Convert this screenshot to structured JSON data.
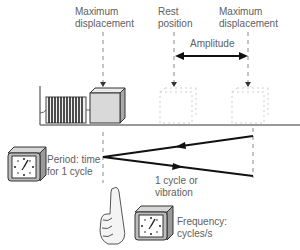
{
  "labels": {
    "max_disp_left_l1": "Maximum",
    "max_disp_left_l2": "displacement",
    "rest_l1": "Rest",
    "rest_l2": "position",
    "max_disp_right_l1": "Maximum",
    "max_disp_right_l2": "displacement",
    "amplitude": "Amplitude",
    "period_l1": "Period: time",
    "period_l2": "for 1 cycle",
    "cycle_l1": "1 cycle or",
    "cycle_l2": "vibration",
    "freq_l1": "Frequency:",
    "freq_l2": "cycles/s"
  },
  "colors": {
    "line": "#111111",
    "dash": "#888888",
    "text": "#606060",
    "block_fill": "#dcdcdc",
    "clock_body": "#bdbdbd"
  }
}
